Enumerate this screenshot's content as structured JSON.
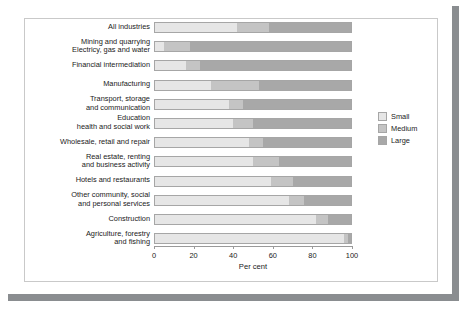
{
  "chart_data": {
    "type": "bar",
    "orientation": "horizontal",
    "stacked": true,
    "title": "",
    "xlabel": "Per cent",
    "ylabel": "",
    "xlim": [
      0,
      100
    ],
    "xticks": [
      0,
      20,
      40,
      60,
      80,
      100
    ],
    "xticklabels": [
      "0",
      "20",
      "40",
      "60",
      "80",
      "100"
    ],
    "grid": false,
    "legend_position": "right",
    "categories": [
      "All industries",
      "Mining and quarrying\nElectricy, gas and water",
      "Financial intermediation",
      "Manufacturing",
      "Transport, storage\nand communication",
      "Education\nhealth and social work",
      "Wholesale, retail and repair",
      "Real estate, renting\nand business activity",
      "Hotels and restaurants",
      "Other community, social\nand personal services",
      "Construction",
      "Agriculture, forestry\nand fishing"
    ],
    "series": [
      {
        "name": "Small",
        "color": "#e6e6e6",
        "values": [
          42,
          5,
          16,
          29,
          38,
          40,
          48,
          50,
          59,
          68,
          82,
          96
        ]
      },
      {
        "name": "Medium",
        "color": "#c4c4c4",
        "values": [
          16,
          13,
          7,
          24,
          7,
          10,
          7,
          13,
          11,
          8,
          6,
          2
        ]
      },
      {
        "name": "Large",
        "color": "#a8a8a8",
        "values": [
          42,
          82,
          77,
          47,
          55,
          50,
          45,
          37,
          30,
          24,
          12,
          2
        ]
      }
    ]
  },
  "legend": {
    "items": [
      {
        "label": "Small"
      },
      {
        "label": "Medium"
      },
      {
        "label": "Large"
      }
    ]
  }
}
